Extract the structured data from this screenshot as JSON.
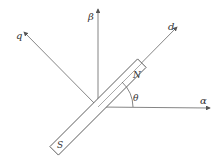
{
  "diagram": {
    "axes": {
      "alpha": {
        "label": "α"
      },
      "beta": {
        "label": "β"
      },
      "d": {
        "label": "d"
      },
      "q": {
        "label": "q"
      }
    },
    "angle": {
      "label": "θ"
    },
    "magnet": {
      "north": "N",
      "south": "S"
    },
    "colors": {
      "stroke": "#555555",
      "background": "#ffffff"
    }
  }
}
